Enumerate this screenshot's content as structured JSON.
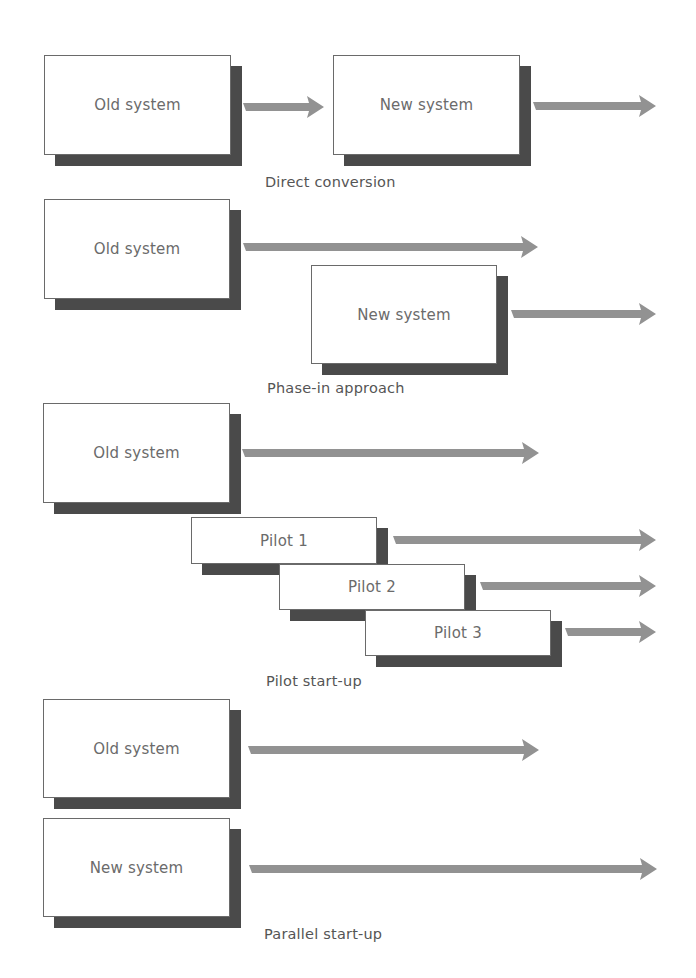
{
  "colors": {
    "arrow": "#929292",
    "shadow": "#4a4a4a",
    "border": "#6a6a6a",
    "text": "#6b6b6b",
    "label": "#555555"
  },
  "sections": {
    "direct": {
      "label": "Direct conversion",
      "boxes": [
        {
          "text": "Old system"
        },
        {
          "text": "New system"
        }
      ]
    },
    "phase_in": {
      "label": "Phase-in approach",
      "boxes": [
        {
          "text": "Old system"
        },
        {
          "text": "New system"
        }
      ]
    },
    "pilot": {
      "label": "Pilot start-up",
      "boxes": [
        {
          "text": "Old system"
        },
        {
          "text": "Pilot 1"
        },
        {
          "text": "Pilot 2"
        },
        {
          "text": "Pilot 3"
        }
      ]
    },
    "parallel": {
      "label": "Parallel start-up",
      "boxes": [
        {
          "text": "Old system"
        },
        {
          "text": "New system"
        }
      ]
    }
  }
}
